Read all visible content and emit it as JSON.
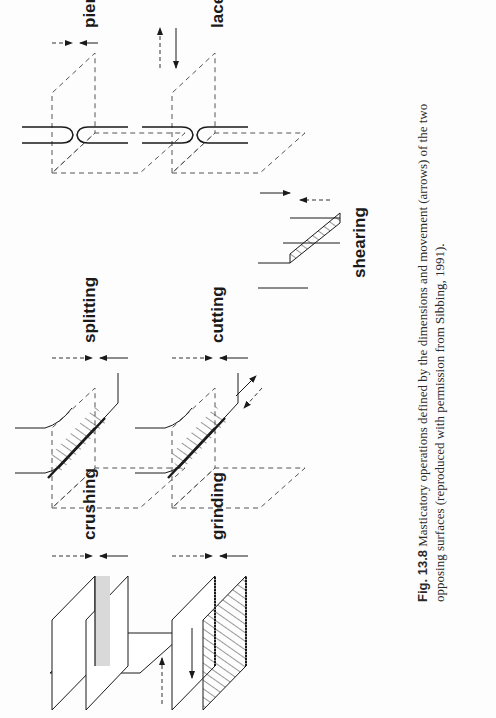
{
  "figure": {
    "number": "Fig. 13.8",
    "caption_text": " Masticatory operations defined by the dimensions and movement (arrows) of the two opposing surfaces (reproduced with permission from Sibbing, 1991).",
    "panels": [
      {
        "id": "crushing",
        "label": "crushing",
        "surface": "flat plates",
        "movement": "perpendicular approach"
      },
      {
        "id": "grinding",
        "label": "grinding",
        "surface": "ridged plates",
        "movement": "perpendicular approach plus lateral sliding"
      },
      {
        "id": "splitting",
        "label": "splitting",
        "surface": "wedge edges",
        "movement": "perpendicular approach"
      },
      {
        "id": "cutting",
        "label": "cutting",
        "surface": "wedge edges",
        "movement": "perpendicular approach plus shearing along edge"
      },
      {
        "id": "shearing",
        "label": "shearing",
        "surface": "blade edges passing",
        "movement": "edges sliding past each other"
      },
      {
        "id": "piercing",
        "label": "piercing",
        "surface": "pointed tips",
        "movement": "perpendicular approach"
      },
      {
        "id": "lacerating",
        "label": "lacerating",
        "surface": "pointed tips",
        "movement": "perpendicular approach plus lateral tearing"
      }
    ]
  },
  "colors": {
    "ink": "#1a1a1a",
    "dashed": "#555555",
    "shade": "#d9d9d9",
    "paper": "#fdfdfd"
  }
}
